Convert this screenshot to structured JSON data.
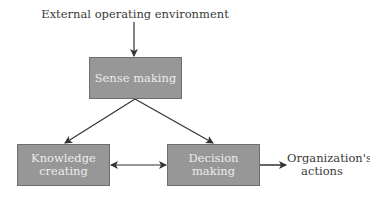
{
  "diagram": {
    "input_label": "External operating environment",
    "nodes": {
      "sense_making": "Sense making",
      "knowledge_line1": "Knowledge",
      "knowledge_line2": "creating",
      "decision_making": "Decision making"
    },
    "output_label_line1": "Organization's",
    "output_label_line2": "actions",
    "edges": [
      {
        "from": "External operating environment",
        "to": "Sense making",
        "type": "arrow"
      },
      {
        "from": "Sense making",
        "to": "Knowledge creating",
        "type": "arrow"
      },
      {
        "from": "Sense making",
        "to": "Decision making",
        "type": "arrow"
      },
      {
        "from": "Knowledge creating",
        "to": "Decision making",
        "type": "bidirectional"
      },
      {
        "from": "Decision making",
        "to": "Organization's actions",
        "type": "arrow"
      }
    ],
    "colors": {
      "box_fill": "#979797",
      "box_text": "#ececec",
      "line": "#333333"
    }
  }
}
